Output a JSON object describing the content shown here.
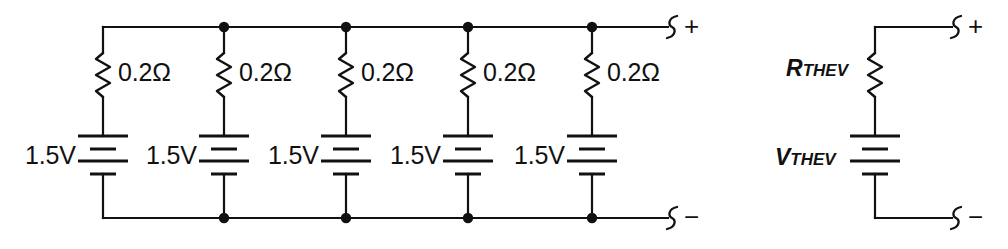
{
  "diagram": {
    "background_color": "#ffffff",
    "line_color": "#111111"
  },
  "left_circuit": {
    "name": "five-parallel-cells",
    "branches": [
      {
        "resistor_label": "0.2Ω",
        "battery_label": "1.5V"
      },
      {
        "resistor_label": "0.2Ω",
        "battery_label": "1.5V"
      },
      {
        "resistor_label": "0.2Ω",
        "battery_label": "1.5V"
      },
      {
        "resistor_label": "0.2Ω",
        "battery_label": "1.5V"
      },
      {
        "resistor_label": "0.2Ω",
        "battery_label": "1.5V"
      }
    ],
    "terminals": {
      "positive_label": "+",
      "negative_label": "−"
    }
  },
  "right_circuit": {
    "name": "thevenin-equivalent",
    "resistor": {
      "symbol": "R",
      "subscript": "THEV"
    },
    "source": {
      "symbol": "V",
      "subscript": "THEV"
    },
    "terminals": {
      "positive_label": "+",
      "negative_label": "−"
    }
  }
}
